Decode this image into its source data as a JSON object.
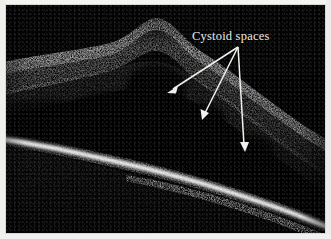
{
  "figure": {
    "name": "oct-retinal-scan",
    "modality": "Optical coherence tomography B-scan",
    "background_color": "#000000",
    "border_color": "#d8d8d4"
  },
  "annotation": {
    "label": "Cystoid spaces",
    "label_color": "#eceae4",
    "label_x": 186,
    "label_y": 24,
    "arrow_color": "#f2f0ea",
    "arrow_origin": {
      "x": 232,
      "y": 42
    },
    "arrows": [
      {
        "name": "arrow-to-left-cystoid",
        "tip_x": 162,
        "tip_y": 88,
        "target": "large central cystoid cavity"
      },
      {
        "name": "arrow-to-middle-cystoid",
        "tip_x": 197,
        "tip_y": 114,
        "target": "inferior cystoid cavity"
      },
      {
        "name": "arrow-to-right-cystoid",
        "tip_x": 239,
        "tip_y": 146,
        "target": "temporal cystoid cavity"
      }
    ]
  },
  "scan_features": {
    "inner_retinal_band": "hyperreflective inner retinal surface, elevated into a dome at centre",
    "foveal_peak_x": 150,
    "foveal_peak_y": 40,
    "cystoid_spaces": "hyporeflective (dark) intraretinal cavities beneath the elevated surface",
    "rpe_band": "bright hyperreflective RPE/choriocapillaris band sloping from upper-left to lower-right",
    "choroid": "dark low-signal region below the RPE band"
  }
}
